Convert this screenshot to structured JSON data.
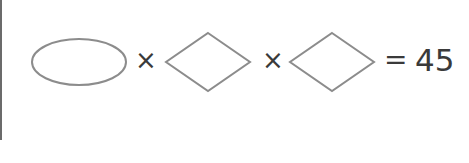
{
  "equation": {
    "terms": [
      {
        "shape": "ellipse",
        "value": ""
      },
      {
        "shape": "diamond",
        "value": ""
      },
      {
        "shape": "diamond",
        "value": ""
      }
    ],
    "operators": [
      "×",
      "×"
    ],
    "equals": "=",
    "result": "45"
  },
  "colors": {
    "shape_stroke": "#8c8c8c",
    "text": "#3a3a3a",
    "rule": "#6b6b6b",
    "background": "#ffffff"
  }
}
